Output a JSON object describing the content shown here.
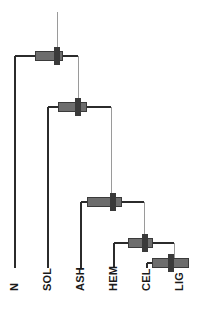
{
  "chart_data": {
    "type": "dendrogram",
    "title": "",
    "subtitle": "",
    "xlabel": "",
    "ylabel": "",
    "orientation": "vertical-leaves-bottom",
    "grid": false,
    "legend": null,
    "axis_visible": false,
    "leaves": [
      {
        "id": "N",
        "label": "N",
        "x": 15,
        "order": 1
      },
      {
        "id": "SOL",
        "label": "SOL",
        "x": 48,
        "order": 2
      },
      {
        "id": "ASH",
        "label": "ASH",
        "x": 81,
        "order": 3
      },
      {
        "id": "HEM",
        "label": "HEM",
        "x": 114,
        "order": 4
      },
      {
        "id": "CEL",
        "label": "CEL",
        "x": 147,
        "order": 5
      },
      {
        "id": "LIG",
        "label": "LIG",
        "x": 180,
        "order": 6
      }
    ],
    "leaf_baseline_y": 268,
    "root_stem_top_y": 12,
    "merges": [
      {
        "id": "node-1",
        "label": "node-1",
        "height_y": 56,
        "left_child": "N",
        "right_child": "node-2",
        "left_x": 15,
        "right_x": 78,
        "center_x": 57,
        "error_bar_x1": 35,
        "error_bar_x2": 62,
        "tick_x": 57
      },
      {
        "id": "node-2",
        "label": "node-2",
        "height_y": 107,
        "left_child": "SOL",
        "right_child": "node-3",
        "left_x": 48,
        "right_x": 111,
        "center_x": 78,
        "error_bar_x1": 58,
        "error_bar_x2": 86,
        "tick_x": 78
      },
      {
        "id": "node-3",
        "label": "node-3",
        "height_y": 202,
        "left_child": "ASH",
        "right_child": "node-4",
        "left_x": 81,
        "right_x": 144,
        "center_x": 111,
        "error_bar_x1": 87,
        "error_bar_x2": 121,
        "tick_x": 113
      },
      {
        "id": "node-4",
        "label": "node-4",
        "height_y": 243,
        "left_child": "HEM",
        "right_child": "node-5",
        "left_x": 114,
        "right_x": 174,
        "center_x": 144,
        "error_bar_x1": 128,
        "error_bar_x2": 152,
        "tick_x": 145
      },
      {
        "id": "node-5",
        "label": "node-5",
        "height_y": 263,
        "left_child": "CEL",
        "right_child": "LIG",
        "left_x": 147,
        "right_x": 180,
        "center_x": 163,
        "error_bar_x1": 152,
        "error_bar_x2": 188,
        "tick_x": 171
      }
    ],
    "colors": {
      "branch_line": "#2b2b2b",
      "thin_connector": "#9a9a9a",
      "error_bar_fill": "#6d6d6d",
      "error_bar_stroke": "#3a3a3a",
      "tick_fill": "#3a3a3a",
      "label_text": "#1a1a1a",
      "background": "#ffffff"
    }
  },
  "labels": {
    "leaf_1": "N",
    "leaf_2": "SOL",
    "leaf_3": "ASH",
    "leaf_4": "HEM",
    "leaf_5": "CEL",
    "leaf_6": "LIG"
  }
}
